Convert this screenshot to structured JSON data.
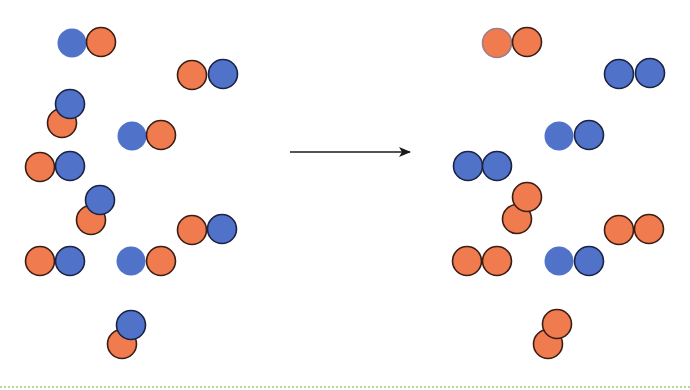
{
  "diagram": {
    "colors": {
      "orange_fill": "#F07B4F",
      "blue_fill": "#5073C9",
      "orange_stroke": "#3a1d14",
      "blue_stroke": "#1b2244",
      "faint_orange_stroke": "#9b7d8c",
      "arrow": "#1a1a1a",
      "bottom_rule": "#b9d98c"
    },
    "atom_radius": 14.5,
    "arrow": {
      "x1": 290,
      "y1": 152,
      "x2": 410,
      "y2": 152
    },
    "reactants": [
      {
        "atoms": [
          {
            "x": 72,
            "y": 43,
            "color": "blue",
            "stroke": "none"
          },
          {
            "x": 101,
            "y": 42,
            "color": "orange",
            "stroke": "dark"
          }
        ]
      },
      {
        "atoms": [
          {
            "x": 192,
            "y": 75,
            "color": "orange",
            "stroke": "dark"
          },
          {
            "x": 223,
            "y": 74,
            "color": "blue",
            "stroke": "dark"
          }
        ]
      },
      {
        "atoms": [
          {
            "x": 62,
            "y": 123,
            "color": "orange",
            "stroke": "dark"
          },
          {
            "x": 70,
            "y": 104,
            "color": "blue",
            "stroke": "dark"
          }
        ]
      },
      {
        "atoms": [
          {
            "x": 132,
            "y": 136,
            "color": "blue",
            "stroke": "none"
          },
          {
            "x": 161,
            "y": 135,
            "color": "orange",
            "stroke": "dark"
          }
        ]
      },
      {
        "atoms": [
          {
            "x": 40,
            "y": 167,
            "color": "orange",
            "stroke": "dark"
          },
          {
            "x": 70,
            "y": 166,
            "color": "blue",
            "stroke": "dark"
          }
        ]
      },
      {
        "atoms": [
          {
            "x": 91,
            "y": 220,
            "color": "orange",
            "stroke": "dark"
          },
          {
            "x": 100,
            "y": 200,
            "color": "blue",
            "stroke": "dark"
          }
        ]
      },
      {
        "atoms": [
          {
            "x": 192,
            "y": 230,
            "color": "orange",
            "stroke": "dark"
          },
          {
            "x": 222,
            "y": 229,
            "color": "blue",
            "stroke": "dark"
          }
        ]
      },
      {
        "atoms": [
          {
            "x": 40,
            "y": 261,
            "color": "orange",
            "stroke": "dark"
          },
          {
            "x": 70,
            "y": 261,
            "color": "blue",
            "stroke": "dark"
          }
        ]
      },
      {
        "atoms": [
          {
            "x": 131,
            "y": 261,
            "color": "blue",
            "stroke": "none"
          },
          {
            "x": 161,
            "y": 261,
            "color": "orange",
            "stroke": "dark"
          }
        ]
      },
      {
        "atoms": [
          {
            "x": 122,
            "y": 344,
            "color": "orange",
            "stroke": "dark"
          },
          {
            "x": 131,
            "y": 325,
            "color": "blue",
            "stroke": "dark"
          }
        ]
      }
    ],
    "products": [
      {
        "atoms": [
          {
            "x": 497,
            "y": 43,
            "color": "orange",
            "stroke": "faint"
          },
          {
            "x": 527,
            "y": 42,
            "color": "orange",
            "stroke": "dark"
          }
        ]
      },
      {
        "atoms": [
          {
            "x": 619,
            "y": 74,
            "color": "blue",
            "stroke": "dark"
          },
          {
            "x": 650,
            "y": 73,
            "color": "blue",
            "stroke": "dark"
          }
        ]
      },
      {
        "atoms": [
          {
            "x": 559,
            "y": 136,
            "color": "blue",
            "stroke": "none"
          },
          {
            "x": 589,
            "y": 135,
            "color": "blue",
            "stroke": "dark"
          }
        ]
      },
      {
        "atoms": [
          {
            "x": 468,
            "y": 166,
            "color": "blue",
            "stroke": "dark"
          },
          {
            "x": 497,
            "y": 166,
            "color": "blue",
            "stroke": "dark"
          }
        ]
      },
      {
        "atoms": [
          {
            "x": 517,
            "y": 219,
            "color": "orange",
            "stroke": "dark"
          },
          {
            "x": 527,
            "y": 197,
            "color": "orange",
            "stroke": "dark"
          }
        ]
      },
      {
        "atoms": [
          {
            "x": 619,
            "y": 230,
            "color": "orange",
            "stroke": "dark"
          },
          {
            "x": 649,
            "y": 229,
            "color": "orange",
            "stroke": "dark"
          }
        ]
      },
      {
        "atoms": [
          {
            "x": 467,
            "y": 261,
            "color": "orange",
            "stroke": "dark"
          },
          {
            "x": 497,
            "y": 261,
            "color": "orange",
            "stroke": "dark"
          }
        ]
      },
      {
        "atoms": [
          {
            "x": 559,
            "y": 261,
            "color": "blue",
            "stroke": "none"
          },
          {
            "x": 589,
            "y": 261,
            "color": "blue",
            "stroke": "dark"
          }
        ]
      },
      {
        "atoms": [
          {
            "x": 548,
            "y": 344,
            "color": "orange",
            "stroke": "dark"
          },
          {
            "x": 557,
            "y": 324,
            "color": "orange",
            "stroke": "dark"
          }
        ]
      }
    ]
  }
}
